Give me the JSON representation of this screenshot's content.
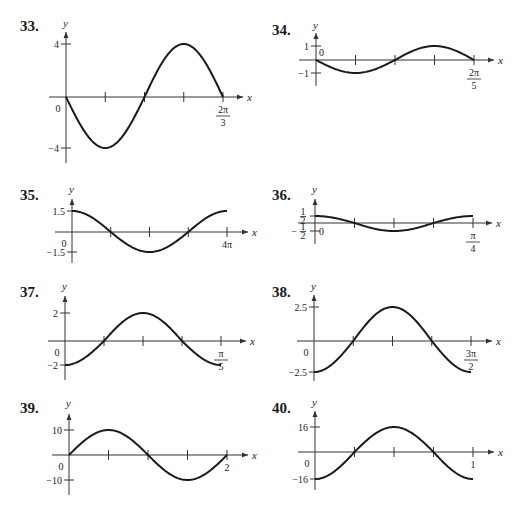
{
  "chart_data": [
    {
      "type": "line",
      "problem": "33.",
      "xlabel": "x",
      "ylabel": "y",
      "function": "y = -4 sin(3x)",
      "curve": {
        "kind": "sin",
        "amplitude": -4,
        "cycles": 1
      },
      "xlim": [
        0,
        "2π/3"
      ],
      "x_end_label": {
        "num": "2π",
        "den": "3"
      },
      "origin_label": "0",
      "y_ticks": [
        {
          "value": 4,
          "label": "4"
        },
        {
          "value": -4,
          "label": "-4"
        }
      ],
      "ylim": [
        -4,
        4
      ],
      "x_ticks_quarters": 4
    },
    {
      "type": "line",
      "problem": "34.",
      "xlabel": "x",
      "ylabel": "y",
      "function": "y = -sin(5x)",
      "curve": {
        "kind": "sin",
        "amplitude": -1,
        "cycles": 1
      },
      "xlim": [
        0,
        "2π/5"
      ],
      "x_end_label": {
        "num": "2π",
        "den": "5"
      },
      "origin_label": "0",
      "y_ticks": [
        {
          "value": 1,
          "label": "1"
        },
        {
          "value": -1,
          "label": "-1"
        }
      ],
      "ylim": [
        -1,
        1
      ],
      "x_ticks_quarters": 4
    },
    {
      "type": "line",
      "problem": "35.",
      "xlabel": "x",
      "ylabel": "y",
      "function": "y = 1.5 cos(x/2)",
      "curve": {
        "kind": "cos",
        "amplitude": 1.5,
        "cycles": 1
      },
      "xlim": [
        0,
        "4π"
      ],
      "x_end_label": {
        "text": "4π"
      },
      "origin_label": "0",
      "y_ticks": [
        {
          "value": 1.5,
          "label": "1.5"
        },
        {
          "value": -1.5,
          "label": "-1.5"
        }
      ],
      "ylim": [
        -1.5,
        1.5
      ],
      "x_ticks_quarters": 4
    },
    {
      "type": "line",
      "problem": "36.",
      "xlabel": "x",
      "ylabel": "y",
      "function": "y = (1/2) cos(8x)",
      "curve": {
        "kind": "cos",
        "amplitude": 0.5,
        "cycles": 1
      },
      "xlim": [
        0,
        "π/4"
      ],
      "x_end_label": {
        "num": "π",
        "den": "4"
      },
      "origin_label": "0",
      "y_ticks": [
        {
          "value": 0.5,
          "label_num": "1",
          "label_den": "2"
        },
        {
          "value": -0.5,
          "label_num": "1",
          "label_den": "2",
          "neg": true
        }
      ],
      "ylim": [
        -0.5,
        0.5
      ],
      "x_ticks_quarters": 4
    },
    {
      "type": "line",
      "problem": "37.",
      "xlabel": "x",
      "ylabel": "y",
      "function": "y = -2 cos(10x)",
      "curve": {
        "kind": "cos",
        "amplitude": -2,
        "cycles": 1
      },
      "xlim": [
        0,
        "π/5"
      ],
      "x_end_label": {
        "num": "π",
        "den": "5"
      },
      "origin_label": "0",
      "y_ticks": [
        {
          "value": 2,
          "label": "2"
        },
        {
          "value": -2,
          "label": "-2"
        }
      ],
      "ylim": [
        -2,
        2
      ],
      "x_ticks_quarters": 4
    },
    {
      "type": "line",
      "problem": "38.",
      "xlabel": "x",
      "ylabel": "y",
      "function": "y = -2.5 cos(4x/3)",
      "curve": {
        "kind": "cos",
        "amplitude": -2.5,
        "cycles": 1
      },
      "xlim": [
        0,
        "3π/2"
      ],
      "x_end_label": {
        "num": "3π",
        "den": "2"
      },
      "origin_label": "0",
      "y_ticks": [
        {
          "value": 2.5,
          "label": "2.5"
        },
        {
          "value": -2.5,
          "label": "-2.5"
        }
      ],
      "ylim": [
        -2.5,
        2.5
      ],
      "x_ticks_quarters": 4
    },
    {
      "type": "line",
      "problem": "39.",
      "xlabel": "x",
      "ylabel": "y",
      "function": "y = 10 sin(πx)",
      "curve": {
        "kind": "sin",
        "amplitude": 10,
        "cycles": 1
      },
      "xlim": [
        0,
        2
      ],
      "x_end_label": {
        "text": "2"
      },
      "origin_label": "0",
      "y_ticks": [
        {
          "value": 10,
          "label": "10"
        },
        {
          "value": -10,
          "label": "-10"
        }
      ],
      "ylim": [
        -10,
        10
      ],
      "x_ticks_quarters": 4
    },
    {
      "type": "line",
      "problem": "40.",
      "xlabel": "x",
      "ylabel": "y",
      "function": "y = -16 cos(2πx)",
      "curve": {
        "kind": "cos",
        "amplitude": -16,
        "cycles": 1
      },
      "xlim": [
        0,
        1
      ],
      "x_end_label": {
        "text": "1"
      },
      "origin_label": "0",
      "y_ticks": [
        {
          "value": 16,
          "label": "16"
        },
        {
          "value": -16,
          "label": "-16"
        }
      ],
      "ylim": [
        -16,
        16
      ],
      "x_ticks_quarters": 4
    }
  ]
}
